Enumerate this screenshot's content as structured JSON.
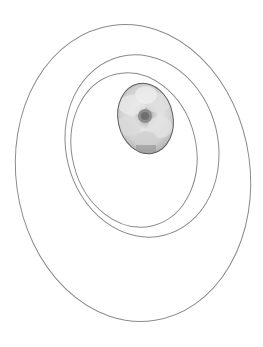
{
  "figure": {
    "stroke_color": "#8a8a8a",
    "background": "#ffffff",
    "rings": [
      {
        "name": "outer-ring",
        "cx": 133,
        "cy": 173,
        "rx": 117,
        "ry": 149,
        "rotate": -8
      },
      {
        "name": "middle-ring",
        "cx": 142,
        "cy": 146,
        "rx": 76,
        "ry": 92,
        "rotate": -14
      },
      {
        "name": "inner-ring",
        "cx": 134,
        "cy": 150,
        "rx": 62,
        "ry": 78,
        "rotate": -14
      }
    ],
    "photo": {
      "subject": "white flower (gardenia)",
      "cx": 145.5,
      "cy": 118.5,
      "rx": 27.5,
      "ry": 35.5,
      "rotate": -12
    }
  }
}
